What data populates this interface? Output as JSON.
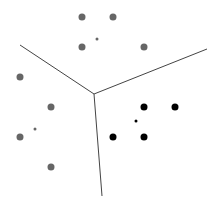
{
  "canvas": {
    "width": 217,
    "height": 206,
    "background": "#ffffff"
  },
  "colors": {
    "boundary": "#444444",
    "cluster_gray": "#666666",
    "cluster_black": "#000000"
  },
  "boundaries": [
    {
      "x1": 20,
      "y1": 45,
      "x2": 94,
      "y2": 94
    },
    {
      "x1": 94,
      "y1": 94,
      "x2": 207,
      "y2": 49
    },
    {
      "x1": 94,
      "y1": 94,
      "x2": 102,
      "y2": 196
    }
  ],
  "clusters": [
    {
      "name": "top",
      "color": "#666666",
      "points": [
        [
          82,
          17
        ],
        [
          113,
          17
        ],
        [
          82,
          47
        ],
        [
          144,
          47
        ]
      ],
      "centroid": [
        97,
        39
      ]
    },
    {
      "name": "left",
      "color": "#666666",
      "points": [
        [
          20,
          77
        ],
        [
          51,
          107
        ],
        [
          20,
          137
        ],
        [
          51,
          167
        ]
      ],
      "centroid": [
        35,
        129
      ]
    },
    {
      "name": "right",
      "color": "#000000",
      "points": [
        [
          144,
          107
        ],
        [
          175,
          107
        ],
        [
          113,
          137
        ],
        [
          144,
          137
        ]
      ],
      "centroid": [
        136,
        121
      ]
    }
  ],
  "point_radius": 3.5,
  "centroid_radius": 1.5
}
